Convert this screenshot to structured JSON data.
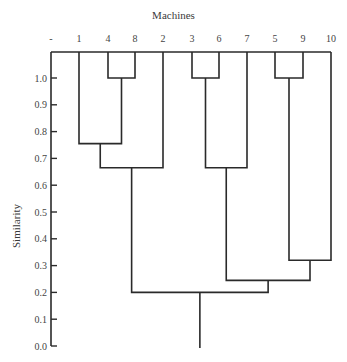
{
  "chart_data": {
    "type": "dendrogram",
    "title": "Machines",
    "xlabel": "Machines",
    "ylabel": "Similarity",
    "ylim": [
      0.0,
      1.0
    ],
    "yticks": [
      "0.0",
      "0.1",
      "0.2",
      "0.3",
      "0.4",
      "0.5",
      "0.6",
      "0.7",
      "0.8",
      "0.9",
      "1.0"
    ],
    "leaf_order": [
      "1",
      "4",
      "8",
      "2",
      "3",
      "6",
      "7",
      "5",
      "9",
      "10"
    ],
    "top_left_label": "-",
    "merges": [
      {
        "clusters": [
          "4",
          "8"
        ],
        "similarity": 1.0
      },
      {
        "clusters": [
          "3",
          "6"
        ],
        "similarity": 1.0
      },
      {
        "clusters": [
          "5",
          "9"
        ],
        "similarity": 1.0
      },
      {
        "clusters": [
          "1",
          "(4,8)"
        ],
        "similarity": 0.755
      },
      {
        "clusters": [
          "(1,4,8)",
          "2"
        ],
        "similarity": 0.665
      },
      {
        "clusters": [
          "(3,6)",
          "7"
        ],
        "similarity": 0.665
      },
      {
        "clusters": [
          "(5,9)",
          "10"
        ],
        "similarity": 0.32
      },
      {
        "clusters": [
          "(3,6,7)",
          "(5,9,10)"
        ],
        "similarity": 0.245
      },
      {
        "clusters": [
          "(1,4,8,2)",
          "(3,6,7,5,9,10)"
        ],
        "similarity": 0.2
      }
    ],
    "grid": false
  }
}
